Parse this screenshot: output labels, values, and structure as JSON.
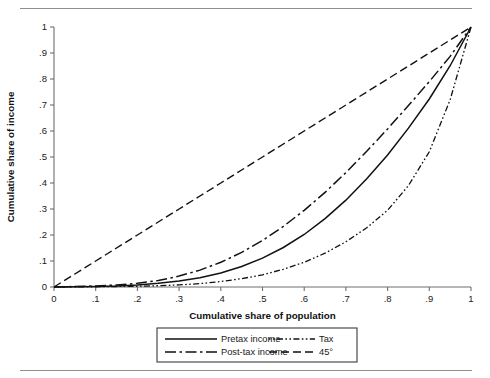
{
  "figure": {
    "rules": {
      "top": "horizontal-rule",
      "bottom": "horizontal-rule"
    }
  },
  "chart_data": {
    "type": "line",
    "title": "",
    "subtitle": "",
    "xlabel": "Cumulative share of population",
    "ylabel": "Cumulative share of income",
    "xlim": [
      0,
      1
    ],
    "ylim": [
      0,
      1
    ],
    "grid": false,
    "legend_position": "below-axes",
    "xticks": [
      0,
      0.1,
      0.2,
      0.3,
      0.4,
      0.5,
      0.6,
      0.7,
      0.8,
      0.9,
      1
    ],
    "xticklabels": [
      "0",
      ".1",
      ".2",
      ".3",
      ".4",
      ".5",
      ".6",
      ".7",
      ".8",
      ".9",
      "1"
    ],
    "yticks": [
      0,
      0.1,
      0.2,
      0.3,
      0.4,
      0.5,
      0.6,
      0.7,
      0.8,
      0.9,
      1
    ],
    "yticklabels": [
      "0",
      ".1",
      ".2",
      ".3",
      ".4",
      ".5",
      ".6",
      ".7",
      ".8",
      ".9",
      "1"
    ],
    "x": [
      0,
      0.05,
      0.1,
      0.15,
      0.2,
      0.25,
      0.3,
      0.35,
      0.4,
      0.45,
      0.5,
      0.55,
      0.6,
      0.65,
      0.7,
      0.75,
      0.8,
      0.85,
      0.9,
      0.95,
      1
    ],
    "series": [
      {
        "name": "Pretax income",
        "style": "solid",
        "values": [
          0,
          0.001,
          0.002,
          0.004,
          0.008,
          0.014,
          0.023,
          0.036,
          0.054,
          0.079,
          0.111,
          0.152,
          0.202,
          0.263,
          0.334,
          0.416,
          0.508,
          0.611,
          0.723,
          0.851,
          1
        ]
      },
      {
        "name": "Tax",
        "style": "dash-dot-dot",
        "values": [
          0,
          0.0004,
          0.001,
          0.002,
          0.003,
          0.005,
          0.008,
          0.013,
          0.021,
          0.032,
          0.047,
          0.068,
          0.095,
          0.13,
          0.174,
          0.228,
          0.295,
          0.39,
          0.52,
          0.72,
          1
        ]
      },
      {
        "name": "Post-tax income",
        "style": "long-dash-dot",
        "values": [
          0,
          0.002,
          0.004,
          0.008,
          0.014,
          0.025,
          0.042,
          0.065,
          0.095,
          0.133,
          0.179,
          0.233,
          0.295,
          0.364,
          0.44,
          0.522,
          0.608,
          0.698,
          0.79,
          0.887,
          1
        ]
      },
      {
        "name": "45°",
        "style": "dashed",
        "values": [
          0,
          0.05,
          0.1,
          0.15,
          0.2,
          0.25,
          0.3,
          0.35,
          0.4,
          0.45,
          0.5,
          0.55,
          0.6,
          0.65,
          0.7,
          0.75,
          0.8,
          0.85,
          0.9,
          0.95,
          1
        ]
      }
    ],
    "legend": [
      {
        "label": "Pretax income",
        "style": "solid"
      },
      {
        "label": "Tax",
        "style": "dash-dot-dot"
      },
      {
        "label": "Post-tax income",
        "style": "long-dash-dot"
      },
      {
        "label": "45°",
        "style": "dashed"
      }
    ]
  }
}
